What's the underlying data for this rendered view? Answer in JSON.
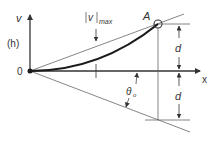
{
  "diagram": {
    "labels": {
      "v_axis": "v",
      "h_axis": "(h)",
      "origin": "0",
      "x_axis": "x",
      "point": "A",
      "vmax_v": "v",
      "vmax_sub": "max",
      "d_upper": "d",
      "d_lower": "d",
      "theta": "θ",
      "theta_sub": "o"
    },
    "colors": {
      "line": "#555555",
      "curve": "#1a1a1a",
      "text": "#333333"
    }
  }
}
